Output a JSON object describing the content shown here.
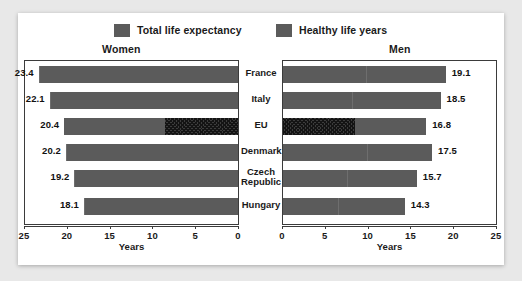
{
  "legend": {
    "items": [
      {
        "label": "Total life expectancy",
        "swatch": "solid-gray-swatch",
        "color": "#5b5b5b"
      },
      {
        "label": "Healthy life years",
        "swatch": "solid-gray-swatch",
        "color": "#5b5b5b"
      }
    ]
  },
  "panels": {
    "women": {
      "title": "Women",
      "axis_title": "Years"
    },
    "men": {
      "title": "Men",
      "axis_title": "Years"
    }
  },
  "axis": {
    "women_ticks": [
      "25",
      "20",
      "15",
      "10",
      "5",
      "0"
    ],
    "men_ticks": [
      "0",
      "5",
      "10",
      "15",
      "20",
      "25"
    ]
  },
  "categories": [
    "France",
    "Italy",
    "EU",
    "Denmark",
    "Czech Republic",
    "Hungary"
  ],
  "values": {
    "women": [
      "23.4",
      "22.1",
      "20.4",
      "20.2",
      "19.2",
      "18.1"
    ],
    "men": [
      "19.1",
      "18.5",
      "16.8",
      "17.5",
      "15.7",
      "14.3"
    ]
  },
  "chart_data": {
    "type": "bar",
    "orientation": "horizontal",
    "layout": "back-to-back paired panels (Women mirrored left, Men right)",
    "categories": [
      "France",
      "Italy",
      "EU",
      "Denmark",
      "Czech Republic",
      "Hungary"
    ],
    "xlabel": "Years",
    "ylabel": "",
    "xlim": [
      0,
      25
    ],
    "xticks": [
      0,
      5,
      10,
      15,
      20,
      25
    ],
    "grid": false,
    "legend_position": "top-center",
    "panels": [
      {
        "name": "Women",
        "direction": "right-to-left",
        "axis_ticks": [
          25,
          20,
          15,
          10,
          5,
          0
        ],
        "series": [
          {
            "name": "Total life expectancy",
            "values": [
              23.4,
              22.1,
              20.4,
              20.2,
              19.2,
              18.1
            ],
            "data_labels": [
              "23.4",
              "22.1",
              "20.4",
              "20.2",
              "19.2",
              "18.1"
            ]
          },
          {
            "name": "Healthy life years",
            "values": [
              11.5,
              10.9,
              8.6,
              10.8,
              9.2,
              9.0
            ],
            "note": "inner segment of each bar; shown hatched for the EU row"
          }
        ],
        "highlighted_category": "EU"
      },
      {
        "name": "Men",
        "direction": "left-to-right",
        "axis_ticks": [
          0,
          5,
          10,
          15,
          20,
          25
        ],
        "series": [
          {
            "name": "Total life expectancy",
            "values": [
              19.1,
              18.5,
              16.8,
              17.5,
              15.7,
              14.3
            ],
            "data_labels": [
              "19.1",
              "18.5",
              "16.8",
              "17.5",
              "15.7",
              "14.3"
            ]
          },
          {
            "name": "Healthy life years",
            "values": [
              9.8,
              8.1,
              8.5,
              9.9,
              7.6,
              6.5
            ],
            "note": "inner segment of each bar; shown hatched for the EU row"
          }
        ],
        "highlighted_category": "EU"
      }
    ],
    "colors": {
      "bar": "#5b5b5b",
      "hatch": "#3c3c3c",
      "frame": "#3b3b3b"
    }
  }
}
